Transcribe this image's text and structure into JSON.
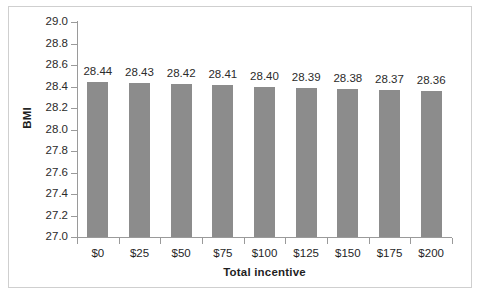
{
  "chart_data": {
    "type": "bar",
    "title": "",
    "categories": [
      "$0",
      "$25",
      "$50",
      "$75",
      "$100",
      "$125",
      "$150",
      "$175",
      "$200"
    ],
    "values": [
      28.44,
      28.43,
      28.42,
      28.41,
      28.4,
      28.39,
      28.38,
      28.37,
      28.36
    ],
    "data_labels": [
      "28.44",
      "28.43",
      "28.42",
      "28.41",
      "28.40",
      "28.39",
      "28.38",
      "28.37",
      "28.36"
    ],
    "xlabel": "Total incentive",
    "ylabel": "BMI",
    "ylim": [
      27.0,
      29.0
    ],
    "ytick_labels": [
      "29.0",
      "28.8",
      "28.6",
      "28.4",
      "28.2",
      "28.0",
      "27.8",
      "27.6",
      "27.4",
      "27.2",
      "27.0"
    ],
    "ytick_values": [
      29.0,
      28.8,
      28.6,
      28.4,
      28.2,
      28.0,
      27.8,
      27.6,
      27.4,
      27.2,
      27.0
    ],
    "grid": false,
    "legend": null,
    "series": [
      {
        "name": "BMI",
        "color": "#8c8c8c",
        "values": [
          28.44,
          28.43,
          28.42,
          28.41,
          28.4,
          28.39,
          28.38,
          28.37,
          28.36
        ]
      }
    ]
  },
  "colors": {
    "bar": "#8c8c8c",
    "axis": "#9a9a9a",
    "text": "#1f1f1f",
    "frame": "#cfcfcf",
    "background": "#ffffff"
  }
}
